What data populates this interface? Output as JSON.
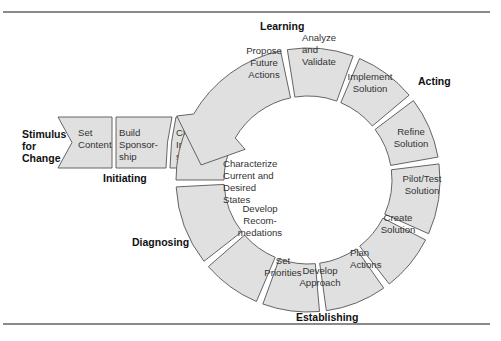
{
  "diagram": {
    "stimulus": [
      "Stimulus",
      "for",
      "Change"
    ],
    "phases": {
      "initiating": "Initiating",
      "diagnosing": "Diagnosing",
      "establishing": "Establishing",
      "acting": "Acting",
      "learning": "Learning"
    },
    "initiating_steps": [
      {
        "lines": [
          "Set",
          "Content"
        ]
      },
      {
        "lines": [
          "Build",
          "Sponsor-",
          "ship"
        ]
      },
      {
        "lines": [
          "Charter",
          "Infra-",
          "structure"
        ]
      }
    ],
    "ring_steps": [
      {
        "lines": [
          "Characterize",
          "Current and",
          "Desired",
          "States"
        ]
      },
      {
        "lines": [
          "Develop",
          "Recom-",
          "medations"
        ]
      },
      {
        "lines": [
          "Set",
          "Priorities"
        ]
      },
      {
        "lines": [
          "Develop",
          "Approach"
        ]
      },
      {
        "lines": [
          "Plan",
          "Actions"
        ]
      },
      {
        "lines": [
          "Create",
          "Solution"
        ]
      },
      {
        "lines": [
          "Pilot/Test",
          "Solution"
        ]
      },
      {
        "lines": [
          "Refine",
          "Solution"
        ]
      },
      {
        "lines": [
          "Implement",
          "Solution"
        ]
      },
      {
        "lines": [
          "Analyze",
          "and",
          "Validate"
        ]
      },
      {
        "lines": [
          "Propose",
          "Future",
          "Actions"
        ]
      }
    ],
    "colors": {
      "fill": "#e0e0e0",
      "stroke": "#555555",
      "text": "#333333",
      "rule": "#8a8a8a"
    }
  }
}
